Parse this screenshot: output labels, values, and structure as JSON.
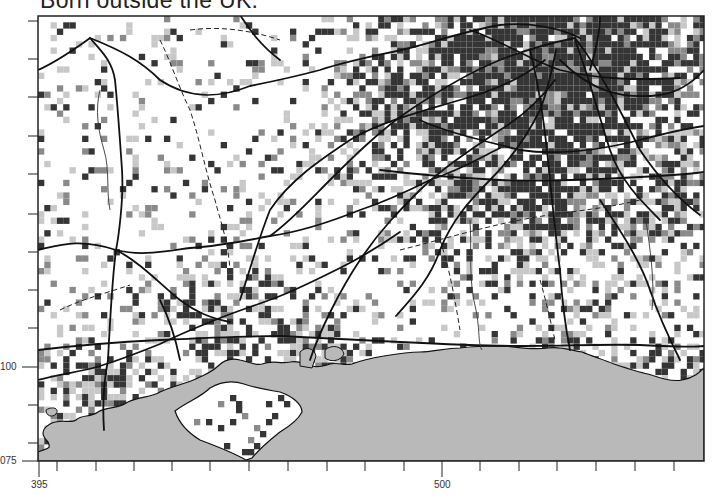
{
  "title": "Born outside the UK.",
  "map": {
    "frame": {
      "left": 38,
      "top": 16,
      "right": 704,
      "bottom": 461
    },
    "cell_size": 6.3,
    "colors": {
      "land": "#ffffff",
      "sea": "#b9b9b9",
      "dark": "#353535",
      "medium": "#8a8a8a",
      "light": "#c8c8c8",
      "road": "#111111",
      "boundary": "#222222",
      "frame": "#222222"
    },
    "density_hotspots": [
      {
        "name": "London",
        "x": 560,
        "y": 50,
        "r": 120,
        "weight": 1.0
      },
      {
        "name": "Southampton",
        "x": 225,
        "y": 320,
        "r": 40,
        "weight": 0.6
      },
      {
        "name": "Portsmouth",
        "x": 315,
        "y": 350,
        "r": 30,
        "weight": 0.7
      },
      {
        "name": "Bournemouth",
        "x": 100,
        "y": 385,
        "r": 40,
        "weight": 0.6
      },
      {
        "name": "Brighton",
        "x": 560,
        "y": 350,
        "r": 30,
        "weight": 0.55
      },
      {
        "name": "Crawley",
        "x": 545,
        "y": 215,
        "r": 30,
        "weight": 0.45
      },
      {
        "name": "Reading",
        "x": 390,
        "y": 110,
        "r": 40,
        "weight": 0.4
      },
      {
        "name": "Guildford",
        "x": 440,
        "y": 200,
        "r": 35,
        "weight": 0.35
      },
      {
        "name": "Eastbourne",
        "x": 680,
        "y": 350,
        "r": 30,
        "weight": 0.45
      },
      {
        "name": "Tunbridge",
        "x": 665,
        "y": 210,
        "r": 30,
        "weight": 0.4
      }
    ]
  },
  "axes": {
    "y_ticks": [
      {
        "y": 21
      },
      {
        "y": 59
      },
      {
        "y": 97
      },
      {
        "y": 136
      },
      {
        "y": 174
      },
      {
        "y": 214
      },
      {
        "y": 252
      },
      {
        "y": 290
      },
      {
        "y": 328
      },
      {
        "y": 367,
        "label": "100"
      },
      {
        "y": 405
      },
      {
        "y": 443
      },
      {
        "y": 461,
        "label": "075"
      }
    ],
    "x_ticks": [
      {
        "x": 39,
        "label": "395"
      },
      {
        "x": 57
      },
      {
        "x": 96
      },
      {
        "x": 134
      },
      {
        "x": 172
      },
      {
        "x": 210
      },
      {
        "x": 249
      },
      {
        "x": 288
      },
      {
        "x": 327
      },
      {
        "x": 365
      },
      {
        "x": 404
      },
      {
        "x": 442,
        "label": "500"
      },
      {
        "x": 480
      },
      {
        "x": 519
      },
      {
        "x": 557
      },
      {
        "x": 596
      },
      {
        "x": 635
      },
      {
        "x": 674
      }
    ],
    "y_label_100": "100",
    "y_label_075": "075",
    "x_label_395": "395",
    "x_label_500": "500"
  }
}
